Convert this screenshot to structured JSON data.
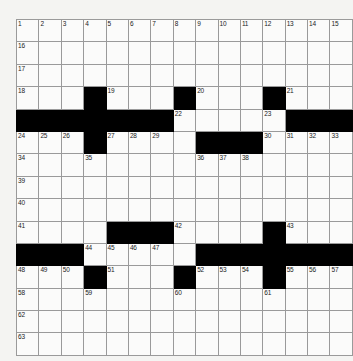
{
  "puzzle": {
    "title": "Crossword Grid",
    "rows": 15,
    "cols": 15,
    "colors": {
      "page_background": "#f4f4f2",
      "cell_fill": "#fbfbfa",
      "block_fill": "#000000",
      "grid_line": "#9a9a9a",
      "border": "#6d6d6d",
      "number_text": "#1a1a1a"
    },
    "grid": [
      [
        {
          "block": false,
          "number": "1"
        },
        {
          "block": false,
          "number": "2"
        },
        {
          "block": false,
          "number": "3"
        },
        {
          "block": false,
          "number": "4"
        },
        {
          "block": false,
          "number": "5"
        },
        {
          "block": false,
          "number": "6"
        },
        {
          "block": false,
          "number": "7"
        },
        {
          "block": false,
          "number": "8"
        },
        {
          "block": false,
          "number": "9"
        },
        {
          "block": false,
          "number": "10"
        },
        {
          "block": false,
          "number": "11"
        },
        {
          "block": false,
          "number": "12"
        },
        {
          "block": false,
          "number": "13"
        },
        {
          "block": false,
          "number": "14"
        },
        {
          "block": false,
          "number": "15"
        }
      ],
      [
        {
          "block": false,
          "number": "16"
        },
        {
          "block": false,
          "number": ""
        },
        {
          "block": false,
          "number": ""
        },
        {
          "block": false,
          "number": ""
        },
        {
          "block": false,
          "number": ""
        },
        {
          "block": false,
          "number": ""
        },
        {
          "block": false,
          "number": ""
        },
        {
          "block": false,
          "number": ""
        },
        {
          "block": false,
          "number": ""
        },
        {
          "block": false,
          "number": ""
        },
        {
          "block": false,
          "number": ""
        },
        {
          "block": false,
          "number": ""
        },
        {
          "block": false,
          "number": ""
        },
        {
          "block": false,
          "number": ""
        },
        {
          "block": false,
          "number": ""
        }
      ],
      [
        {
          "block": false,
          "number": "17"
        },
        {
          "block": false,
          "number": ""
        },
        {
          "block": false,
          "number": ""
        },
        {
          "block": false,
          "number": ""
        },
        {
          "block": false,
          "number": ""
        },
        {
          "block": false,
          "number": ""
        },
        {
          "block": false,
          "number": ""
        },
        {
          "block": false,
          "number": ""
        },
        {
          "block": false,
          "number": ""
        },
        {
          "block": false,
          "number": ""
        },
        {
          "block": false,
          "number": ""
        },
        {
          "block": false,
          "number": ""
        },
        {
          "block": false,
          "number": ""
        },
        {
          "block": false,
          "number": ""
        },
        {
          "block": false,
          "number": ""
        }
      ],
      [
        {
          "block": false,
          "number": "18"
        },
        {
          "block": false,
          "number": ""
        },
        {
          "block": false,
          "number": ""
        },
        {
          "block": true,
          "number": ""
        },
        {
          "block": false,
          "number": "19"
        },
        {
          "block": false,
          "number": ""
        },
        {
          "block": false,
          "number": ""
        },
        {
          "block": true,
          "number": ""
        },
        {
          "block": false,
          "number": "20"
        },
        {
          "block": false,
          "number": ""
        },
        {
          "block": false,
          "number": ""
        },
        {
          "block": true,
          "number": ""
        },
        {
          "block": false,
          "number": "21"
        },
        {
          "block": false,
          "number": ""
        },
        {
          "block": false,
          "number": ""
        }
      ],
      [
        {
          "block": true,
          "number": ""
        },
        {
          "block": true,
          "number": ""
        },
        {
          "block": true,
          "number": ""
        },
        {
          "block": true,
          "number": ""
        },
        {
          "block": true,
          "number": ""
        },
        {
          "block": true,
          "number": ""
        },
        {
          "block": true,
          "number": ""
        },
        {
          "block": false,
          "number": "22"
        },
        {
          "block": false,
          "number": ""
        },
        {
          "block": false,
          "number": ""
        },
        {
          "block": false,
          "number": ""
        },
        {
          "block": false,
          "number": "23"
        },
        {
          "block": true,
          "number": ""
        },
        {
          "block": true,
          "number": ""
        },
        {
          "block": true,
          "number": ""
        }
      ],
      [
        {
          "block": false,
          "number": "24"
        },
        {
          "block": false,
          "number": "25"
        },
        {
          "block": false,
          "number": "26"
        },
        {
          "block": true,
          "number": ""
        },
        {
          "block": false,
          "number": "27"
        },
        {
          "block": false,
          "number": "28"
        },
        {
          "block": false,
          "number": "29"
        },
        {
          "block": false,
          "number": ""
        },
        {
          "block": true,
          "number": ""
        },
        {
          "block": true,
          "number": ""
        },
        {
          "block": true,
          "number": ""
        },
        {
          "block": false,
          "number": "30"
        },
        {
          "block": false,
          "number": "31"
        },
        {
          "block": false,
          "number": "32"
        },
        {
          "block": false,
          "number": "33"
        }
      ],
      [
        {
          "block": false,
          "number": "34"
        },
        {
          "block": false,
          "number": ""
        },
        {
          "block": false,
          "number": ""
        },
        {
          "block": false,
          "number": "35"
        },
        {
          "block": false,
          "number": ""
        },
        {
          "block": false,
          "number": ""
        },
        {
          "block": false,
          "number": ""
        },
        {
          "block": false,
          "number": ""
        },
        {
          "block": false,
          "number": "36"
        },
        {
          "block": false,
          "number": "37"
        },
        {
          "block": false,
          "number": "38"
        },
        {
          "block": false,
          "number": ""
        },
        {
          "block": false,
          "number": ""
        },
        {
          "block": false,
          "number": ""
        },
        {
          "block": false,
          "number": ""
        }
      ],
      [
        {
          "block": false,
          "number": "39"
        },
        {
          "block": false,
          "number": ""
        },
        {
          "block": false,
          "number": ""
        },
        {
          "block": false,
          "number": ""
        },
        {
          "block": false,
          "number": ""
        },
        {
          "block": false,
          "number": ""
        },
        {
          "block": false,
          "number": ""
        },
        {
          "block": false,
          "number": ""
        },
        {
          "block": false,
          "number": ""
        },
        {
          "block": false,
          "number": ""
        },
        {
          "block": false,
          "number": ""
        },
        {
          "block": false,
          "number": ""
        },
        {
          "block": false,
          "number": ""
        },
        {
          "block": false,
          "number": ""
        },
        {
          "block": false,
          "number": ""
        }
      ],
      [
        {
          "block": false,
          "number": "40"
        },
        {
          "block": false,
          "number": ""
        },
        {
          "block": false,
          "number": ""
        },
        {
          "block": false,
          "number": ""
        },
        {
          "block": false,
          "number": ""
        },
        {
          "block": false,
          "number": ""
        },
        {
          "block": false,
          "number": ""
        },
        {
          "block": false,
          "number": ""
        },
        {
          "block": false,
          "number": ""
        },
        {
          "block": false,
          "number": ""
        },
        {
          "block": false,
          "number": ""
        },
        {
          "block": false,
          "number": ""
        },
        {
          "block": false,
          "number": ""
        },
        {
          "block": false,
          "number": ""
        },
        {
          "block": false,
          "number": ""
        }
      ],
      [
        {
          "block": false,
          "number": "41"
        },
        {
          "block": false,
          "number": ""
        },
        {
          "block": false,
          "number": ""
        },
        {
          "block": false,
          "number": ""
        },
        {
          "block": true,
          "number": ""
        },
        {
          "block": true,
          "number": ""
        },
        {
          "block": true,
          "number": ""
        },
        {
          "block": false,
          "number": "42"
        },
        {
          "block": false,
          "number": ""
        },
        {
          "block": false,
          "number": ""
        },
        {
          "block": false,
          "number": ""
        },
        {
          "block": true,
          "number": ""
        },
        {
          "block": false,
          "number": "43"
        },
        {
          "block": false,
          "number": ""
        },
        {
          "block": false,
          "number": ""
        }
      ],
      [
        {
          "block": true,
          "number": ""
        },
        {
          "block": true,
          "number": ""
        },
        {
          "block": true,
          "number": ""
        },
        {
          "block": false,
          "number": "44"
        },
        {
          "block": false,
          "number": "45"
        },
        {
          "block": false,
          "number": "46"
        },
        {
          "block": false,
          "number": "47"
        },
        {
          "block": false,
          "number": ""
        },
        {
          "block": true,
          "number": ""
        },
        {
          "block": true,
          "number": ""
        },
        {
          "block": true,
          "number": ""
        },
        {
          "block": true,
          "number": ""
        },
        {
          "block": true,
          "number": ""
        },
        {
          "block": true,
          "number": ""
        },
        {
          "block": true,
          "number": ""
        }
      ],
      [
        {
          "block": false,
          "number": "48"
        },
        {
          "block": false,
          "number": "49"
        },
        {
          "block": false,
          "number": "50"
        },
        {
          "block": true,
          "number": ""
        },
        {
          "block": false,
          "number": "51"
        },
        {
          "block": false,
          "number": ""
        },
        {
          "block": false,
          "number": ""
        },
        {
          "block": true,
          "number": ""
        },
        {
          "block": false,
          "number": "52"
        },
        {
          "block": false,
          "number": "53"
        },
        {
          "block": false,
          "number": "54"
        },
        {
          "block": true,
          "number": ""
        },
        {
          "block": false,
          "number": "55"
        },
        {
          "block": false,
          "number": "56"
        },
        {
          "block": false,
          "number": "57"
        }
      ],
      [
        {
          "block": false,
          "number": "58"
        },
        {
          "block": false,
          "number": ""
        },
        {
          "block": false,
          "number": ""
        },
        {
          "block": false,
          "number": "59"
        },
        {
          "block": false,
          "number": ""
        },
        {
          "block": false,
          "number": ""
        },
        {
          "block": false,
          "number": ""
        },
        {
          "block": false,
          "number": "60"
        },
        {
          "block": false,
          "number": ""
        },
        {
          "block": false,
          "number": ""
        },
        {
          "block": false,
          "number": ""
        },
        {
          "block": false,
          "number": "61"
        },
        {
          "block": false,
          "number": ""
        },
        {
          "block": false,
          "number": ""
        },
        {
          "block": false,
          "number": ""
        }
      ],
      [
        {
          "block": false,
          "number": "62"
        },
        {
          "block": false,
          "number": ""
        },
        {
          "block": false,
          "number": ""
        },
        {
          "block": false,
          "number": ""
        },
        {
          "block": false,
          "number": ""
        },
        {
          "block": false,
          "number": ""
        },
        {
          "block": false,
          "number": ""
        },
        {
          "block": false,
          "number": ""
        },
        {
          "block": false,
          "number": ""
        },
        {
          "block": false,
          "number": ""
        },
        {
          "block": false,
          "number": ""
        },
        {
          "block": false,
          "number": ""
        },
        {
          "block": false,
          "number": ""
        },
        {
          "block": false,
          "number": ""
        },
        {
          "block": false,
          "number": ""
        }
      ],
      [
        {
          "block": false,
          "number": "63"
        },
        {
          "block": false,
          "number": ""
        },
        {
          "block": false,
          "number": ""
        },
        {
          "block": false,
          "number": ""
        },
        {
          "block": false,
          "number": ""
        },
        {
          "block": false,
          "number": ""
        },
        {
          "block": false,
          "number": ""
        },
        {
          "block": false,
          "number": ""
        },
        {
          "block": false,
          "number": ""
        },
        {
          "block": false,
          "number": ""
        },
        {
          "block": false,
          "number": ""
        },
        {
          "block": false,
          "number": ""
        },
        {
          "block": false,
          "number": ""
        },
        {
          "block": false,
          "number": ""
        },
        {
          "block": false,
          "number": ""
        }
      ]
    ]
  }
}
